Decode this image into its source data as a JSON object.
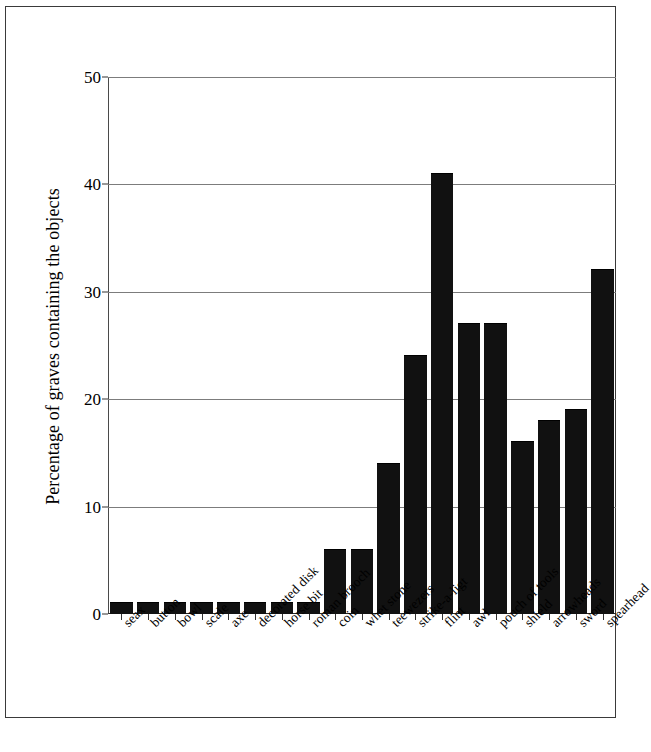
{
  "chart_data": {
    "type": "bar",
    "title": "",
    "subtitle": "",
    "xlabel": "",
    "ylabel": "Percentage of graves containing the objects",
    "ylim": [
      0,
      50
    ],
    "yticks": [
      0,
      10,
      20,
      30,
      40,
      50
    ],
    "grid": true,
    "legend": null,
    "bar_color": "#111111",
    "axis_color": "#333333",
    "gridline_color": "#7c7c7c",
    "categories": [
      "seax",
      "button",
      "bowl",
      "scale",
      "axe",
      "decorated disk",
      "horse bit",
      "roman brooch",
      "coin",
      "whet stone",
      "teewezers",
      "strike-a-ligt",
      "flint",
      "awl",
      "pouch of tools",
      "shield",
      "arrowheads",
      "sword",
      "spearhead"
    ],
    "values": [
      1,
      1,
      1,
      1,
      1,
      1,
      1,
      1,
      6,
      6,
      14,
      24,
      41,
      27,
      27,
      16,
      18,
      19,
      32
    ]
  }
}
